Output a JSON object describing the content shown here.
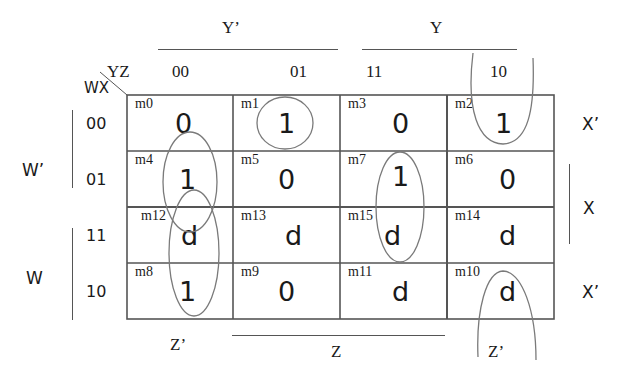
{
  "corner": {
    "col_var": "YZ",
    "row_var": "WX"
  },
  "col_groups": [
    {
      "label": "Y’"
    },
    {
      "label": "Y"
    }
  ],
  "col_headers": [
    "00",
    "01",
    "11",
    "10"
  ],
  "row_groups": [
    {
      "label": "W’"
    },
    {
      "label": "W"
    }
  ],
  "row_headers": [
    "00",
    "01",
    "11",
    "10"
  ],
  "right_labels": [
    "X’",
    "X",
    "X’"
  ],
  "bottom_labels": [
    "Z’",
    "Z",
    "Z’"
  ],
  "cells": [
    [
      {
        "m": "m0",
        "v": "0"
      },
      {
        "m": "m1",
        "v": "1"
      },
      {
        "m": "m3",
        "v": "0"
      },
      {
        "m": "m2",
        "v": "1"
      }
    ],
    [
      {
        "m": "m4",
        "v": "1"
      },
      {
        "m": "m5",
        "v": "0"
      },
      {
        "m": "m7",
        "v": "1"
      },
      {
        "m": "m6",
        "v": "0"
      }
    ],
    [
      {
        "m": "m12",
        "v": "d"
      },
      {
        "m": "m13",
        "v": "d"
      },
      {
        "m": "m15",
        "v": "d"
      },
      {
        "m": "m14",
        "v": "d"
      }
    ],
    [
      {
        "m": "m8",
        "v": "1"
      },
      {
        "m": "m9",
        "v": "0"
      },
      {
        "m": "m11",
        "v": "d"
      },
      {
        "m": "m10",
        "v": "d"
      }
    ]
  ],
  "groupings": [
    {
      "name": "m1-single",
      "cells": [
        "m1"
      ]
    },
    {
      "name": "m4-m12-pair",
      "cells": [
        "m4",
        "m12"
      ]
    },
    {
      "name": "m12-m8-pair",
      "cells": [
        "m12",
        "m8"
      ]
    },
    {
      "name": "m7-m15-pair",
      "cells": [
        "m7",
        "m15"
      ]
    },
    {
      "name": "m2-m10-wraparound",
      "cells": [
        "m2",
        "m10"
      ]
    }
  ],
  "colors": {
    "grid": "#555555",
    "ovals": "#7a7a7a",
    "text": "#1a1a1a"
  }
}
